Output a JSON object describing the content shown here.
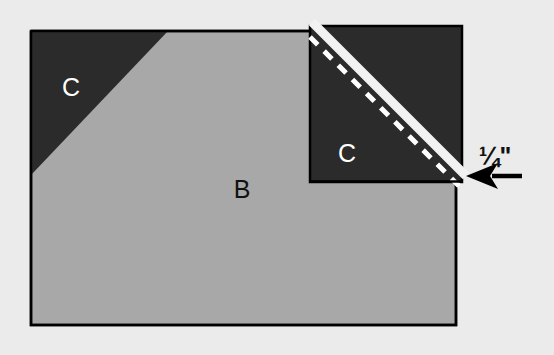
{
  "diagram": {
    "canvas": {
      "width": 554,
      "height": 355,
      "background": "#ebebeb"
    },
    "palette": {
      "background": "#ebebeb",
      "fabric_light": "#a8a8a8",
      "fabric_dark": "#2b2b2b",
      "outline": "#000000",
      "seam_line": "#f2f2f2",
      "stitch_line": "#ffffff",
      "label_light": "#ffffff",
      "label_dark": "#111111"
    },
    "labels": {
      "base_piece": "B",
      "corner_piece_left": "C",
      "corner_piece_right": "C",
      "seam_allowance": "¼\""
    },
    "shapes": {
      "base_rectangle": {
        "name": "base-rectangle-b",
        "points": "31,31 456,31 456,325 31,325",
        "fill": "#a8a8a8",
        "stroke": "#000000",
        "stroke_width": 2.5
      },
      "corner_triangle_left": {
        "name": "corner-triangle-c-left",
        "points": "31,31 168,31 31,175",
        "fill": "#2b2b2b"
      },
      "corner_square_right": {
        "name": "corner-square-c-right",
        "points": "310,26 462,26 462,182 310,182",
        "fill": "#2b2b2b",
        "stroke": "#000000",
        "stroke_width": 2.5
      },
      "seam_stripe": {
        "name": "seam-allowance-stripe",
        "from": "316,26",
        "to": "462,172",
        "color": "#f2f2f2",
        "width": 8
      },
      "stitch_line": {
        "name": "stitch-dashed-line",
        "from": "311,38",
        "to": "457,184",
        "color": "#ffffff",
        "width": 5,
        "dash": "11 9"
      },
      "arrow": {
        "name": "seam-allowance-arrow",
        "tip": "467,176",
        "tail": "521,176",
        "color": "#000000"
      }
    },
    "label_positions": {
      "base_piece": {
        "x": 242,
        "y": 191
      },
      "corner_piece_left": {
        "x": 71,
        "y": 89
      },
      "corner_piece_right": {
        "x": 347,
        "y": 155
      },
      "seam_allowance": {
        "x": 495,
        "y": 158
      }
    }
  }
}
